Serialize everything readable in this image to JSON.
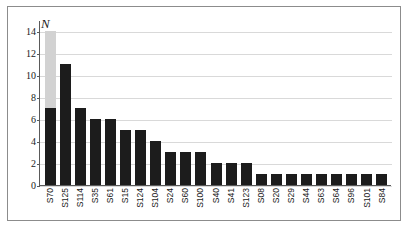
{
  "chart_data": {
    "type": "bar",
    "title": "",
    "subtitle": "",
    "xlabel": "",
    "ylabel": "N",
    "ylim": [
      0,
      15
    ],
    "yticks": [
      0,
      2,
      4,
      6,
      8,
      10,
      12,
      14
    ],
    "ytick_labels": [
      "0",
      "2",
      "4",
      "6",
      "8",
      "10",
      "12",
      "14"
    ],
    "grid": "horizontal",
    "legend": "none",
    "stacked": true,
    "categories": [
      "S70",
      "S125",
      "S114",
      "S35",
      "S61",
      "S15",
      "S124",
      "S104",
      "S24",
      "S60",
      "S100",
      "S40",
      "S41",
      "S123",
      "S08",
      "S20",
      "S29",
      "S44",
      "S63",
      "S64",
      "S96",
      "S101",
      "S84"
    ],
    "series": [
      {
        "name": "primary",
        "color": "#1c1c1c",
        "values": [
          7,
          11,
          7,
          6,
          6,
          5,
          5,
          4,
          3,
          3,
          3,
          2,
          2,
          2,
          1,
          1,
          1,
          1,
          1,
          1,
          1,
          1,
          1
        ]
      },
      {
        "name": "secondary",
        "color": "#d2d2d2",
        "values": [
          7,
          0,
          0,
          0,
          0,
          0,
          0,
          0,
          0,
          0,
          0,
          0,
          0,
          0,
          0,
          0,
          0,
          0,
          0,
          0,
          0,
          0,
          0
        ]
      }
    ],
    "totals": [
      14,
      11,
      7,
      6,
      6,
      5,
      5,
      4,
      3,
      3,
      3,
      2,
      2,
      2,
      1,
      1,
      1,
      1,
      1,
      1,
      1,
      1,
      1
    ],
    "colors": {
      "primary": "#1c1c1c",
      "secondary": "#d2d2d2",
      "gridline": "#d9d9d9",
      "axis": "#5a5a5a",
      "frame": "#8c8c8c",
      "background": "#ffffff"
    }
  }
}
